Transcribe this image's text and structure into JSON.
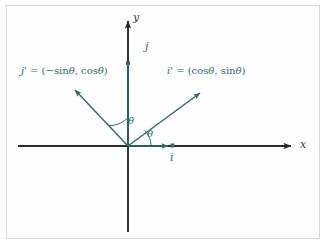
{
  "figure": {
    "type": "vector-diagram",
    "background_color": "#ffffff",
    "frame_color": "#d8d8d8",
    "axis_color": "#2b2b2b",
    "vector_color": "#2f6f68",
    "label_color": "#2e6d66"
  },
  "axes": {
    "x_label": "x",
    "y_label": "y",
    "origin": {
      "x": 128,
      "y": 146
    },
    "x_range_px": {
      "start": 18,
      "end": 296
    },
    "y_range_px": {
      "start": 16,
      "end": 232
    }
  },
  "vectors": [
    {
      "name": "i",
      "label": "i",
      "tip": {
        "x": 172,
        "y": 146
      },
      "label_pos": {
        "x": 168,
        "y": 152
      }
    },
    {
      "name": "j",
      "label": "j",
      "tip": {
        "x": 128,
        "y": 102
      },
      "label_pos": {
        "x": 134,
        "y": 44
      }
    },
    {
      "name": "i-prime",
      "label_parts": {
        "symbol": "i'",
        "equals": " = (",
        "cos": "cos",
        "theta1": "θ",
        "comma": ", ",
        "sin": "sin",
        "theta2": "θ",
        "close": ")"
      },
      "full_label": "i' = (cos θ, sin θ)",
      "tip": {
        "x": 203,
        "y": 90
      },
      "label_pos": {
        "x": 168,
        "y": 68
      }
    },
    {
      "name": "j-prime",
      "label_parts": {
        "symbol": "j'",
        "equals": " = (−",
        "sin": "sin",
        "theta1": "θ",
        "comma": ", ",
        "cos": "cos",
        "theta2": "θ",
        "close": ")"
      },
      "full_label": "j' = (−sin θ, cos θ)",
      "tip": {
        "x": 71,
        "y": 87
      },
      "label_pos": {
        "x": 22,
        "y": 68
      }
    }
  ],
  "angles": [
    {
      "name": "theta-between-x-and-i-prime",
      "label": "θ",
      "label_pos": {
        "x": 147,
        "y": 132
      }
    },
    {
      "name": "theta-between-y-and-j-prime",
      "label": "θ",
      "label_pos": {
        "x": 129,
        "y": 120
      }
    }
  ]
}
